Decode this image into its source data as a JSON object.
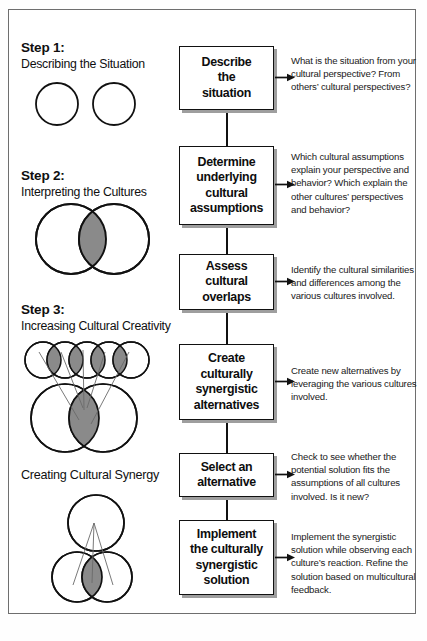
{
  "figure": {
    "title_caption": "",
    "left_column": {
      "steps": [
        {
          "heading": "Step 1:",
          "subheading": "Describing the Situation",
          "diagram_name": "two-separate-circles"
        },
        {
          "heading": "Step 2:",
          "subheading": "Interpreting the Cultures",
          "diagram_name": "two-overlapping-circles-venn"
        },
        {
          "heading": "Step 3:",
          "subheading": "Increasing Cultural Creativity",
          "diagram_name": "five-small-circles-over-two-large-circles"
        }
      ],
      "synergy": {
        "heading": "Creating Cultural Synergy",
        "diagram_name": "three-circle-synergy"
      }
    },
    "flow": {
      "boxes": [
        {
          "label": "Describe\nthe\nsituation"
        },
        {
          "label": "Determine\nunderlying\ncultural\nassumptions"
        },
        {
          "label": "Assess\ncultural\noverlaps"
        },
        {
          "label": "Create\nculturally\nsynergistic\nalternatives"
        },
        {
          "label": "Select an\nalternative"
        },
        {
          "label": "Implement\nthe culturally\nsynergistic\nsolution"
        }
      ]
    },
    "descriptions": [
      "What is the situation from your cultural perspective? From others’ cultural perspectives?",
      "Which cultural assumptions explain your perspective and behavior? Which explain the other cultures’ perspectives and behavior?",
      "Identify the cultural similarities and differences among the various cultures involved.",
      "Create new alternatives by leveraging the various cultures involved.",
      "Check to see whether the potential solution fits the assumptions of all cultures involved. Is it new?",
      "Implement the synergistic solution while observing each culture’s reaction. Refine the solution based on multicultural feedback."
    ],
    "colors": {
      "line": "#111111",
      "box_border": "#111111",
      "box_shadow": "#9e9e9e",
      "frame_border": "#6e6e6e",
      "lens_fill": "#8a8a8a",
      "background": "#ffffff",
      "text": "#101010"
    }
  }
}
